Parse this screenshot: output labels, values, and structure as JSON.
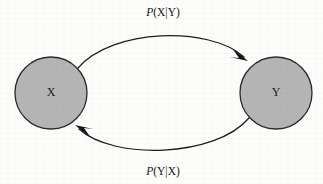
{
  "diagram": {
    "type": "bidirectional-conditional-probability-graph",
    "background_color": "#fdfdfc",
    "node_fill_color": "#b5b5b5",
    "node_stroke_color": "#2a2a2a",
    "edge_color": "#1c1c1c",
    "nodes": [
      {
        "id": "X",
        "label": "X",
        "cx": 51,
        "cy": 93,
        "r": 36
      },
      {
        "id": "Y",
        "label": "Y",
        "cx": 276,
        "cy": 93,
        "r": 36
      }
    ],
    "edges": [
      {
        "id": "x-to-y",
        "from": "X",
        "to": "Y",
        "label_prefix": "P",
        "label_body": "(X|Y)",
        "label_full": "P(X|Y)",
        "label_x": 163,
        "label_y": 13,
        "direction": "left-to-right",
        "curve": "arc-above"
      },
      {
        "id": "y-to-x",
        "from": "Y",
        "to": "X",
        "label_prefix": "P",
        "label_body": "(Y|X)",
        "label_full": "P(Y|X)",
        "label_x": 163,
        "label_y": 172,
        "direction": "right-to-left",
        "curve": "arc-below"
      }
    ]
  }
}
